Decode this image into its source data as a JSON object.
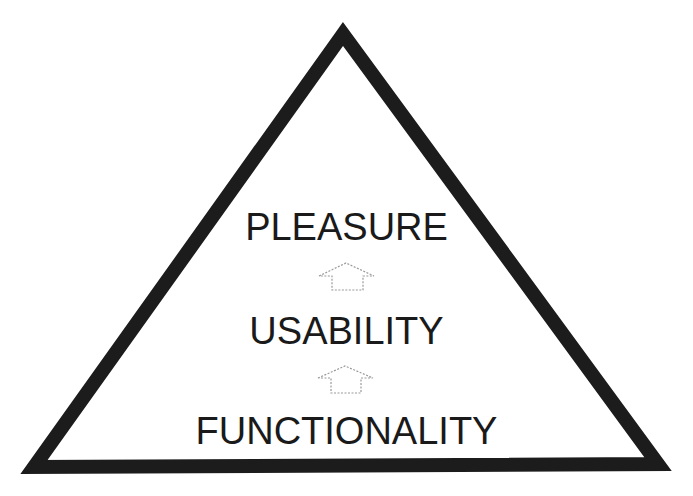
{
  "diagram": {
    "type": "hierarchy-triangle",
    "levels": [
      {
        "label": "PLEASURE",
        "position": "top"
      },
      {
        "label": "USABILITY",
        "position": "middle"
      },
      {
        "label": "FUNCTIONALITY",
        "position": "bottom"
      }
    ],
    "arrows": [
      {
        "from": "USABILITY",
        "to": "PLEASURE",
        "style": "dotted-outline-up-arrow"
      },
      {
        "from": "FUNCTIONALITY",
        "to": "USABILITY",
        "style": "dotted-outline-up-arrow"
      }
    ],
    "colors": {
      "triangle_stroke": "#1c1c1c",
      "text": "#1a1a1a",
      "arrow": "#9a9a9a",
      "background": "#ffffff"
    }
  }
}
